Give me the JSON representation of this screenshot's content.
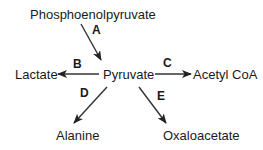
{
  "diagram": {
    "nodes": {
      "pep": "Phosphoenolpyruvate",
      "pyruvate": "Pyruvate",
      "lactate": "Lactate",
      "acetyl_coa": "Acetyl CoA",
      "alanine": "Alanine",
      "oxaloacetate": "Oxaloacetate"
    },
    "edges": [
      {
        "label": "A",
        "from": "Phosphoenolpyruvate",
        "to": "Pyruvate"
      },
      {
        "label": "B",
        "from": "Pyruvate",
        "to": "Lactate"
      },
      {
        "label": "C",
        "from": "Pyruvate",
        "to": "Acetyl CoA"
      },
      {
        "label": "D",
        "from": "Pyruvate",
        "to": "Alanine"
      },
      {
        "label": "E",
        "from": "Pyruvate",
        "to": "Oxaloacetate"
      }
    ],
    "colors": {
      "text": "#1a1a1a",
      "arrow": "#333333",
      "background": "#ffffff"
    }
  }
}
